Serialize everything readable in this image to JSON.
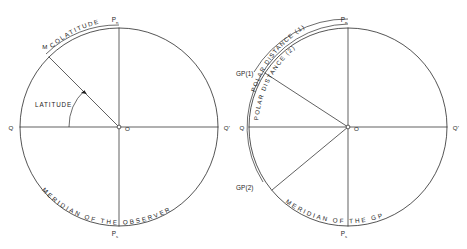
{
  "figure": {
    "background_color": "#ffffff",
    "line_color": "#1c1c1c"
  },
  "left_diagram": {
    "name": "observer-meridian-diagram",
    "center_label": "O",
    "pole_north": "P",
    "pole_north_sub": "n",
    "pole_south": "P",
    "pole_south_sub": "s",
    "equator_left": "Q",
    "equator_right": "Q'",
    "point_m": "M",
    "arc_label_colatitude": "COLATITUDE",
    "angle_label_latitude": "LATITUDE",
    "arc_label_meridian": "MERIDIAN OF THE OBSERVER"
  },
  "right_diagram": {
    "name": "gp-meridian-diagram",
    "center_label": "O",
    "pole_north": "P",
    "pole_north_sub": "n",
    "pole_south": "P",
    "pole_south_sub": "s",
    "equator_left": "Q",
    "equator_right": "Q'",
    "point_gp1": "GP(1)",
    "point_gp2": "GP(2)",
    "arc_label_polar_distance_1": "POLAR DISTANCE (1)",
    "arc_label_polar_distance_2": "POLAR DISTANCE (2)",
    "arc_label_meridian": "MERIDIAN OF THE GP"
  }
}
